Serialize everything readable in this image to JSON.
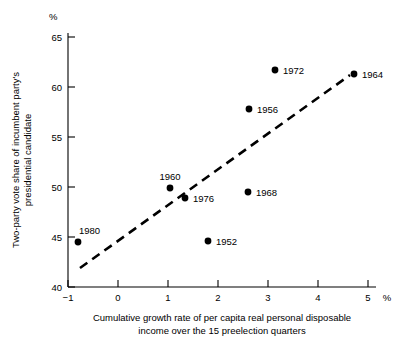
{
  "chart_data": {
    "type": "scatter",
    "title": "",
    "xlabel": "Cumulative growth rate of per capita real personal disposable income over the 15 preelection quarters",
    "xlabel_line1": "Cumulative growth rate of per capita real personal disposable",
    "xlabel_line2": "income over the 15 preelection quarters",
    "ylabel": "Two-party vote share of incumbent party's presidential candidate",
    "ylabel_line1": "Two-party vote share of incumbent party's",
    "ylabel_line2": "presidential candidate",
    "x_unit": "%",
    "y_unit": "%",
    "xlim": [
      -1,
      5
    ],
    "ylim": [
      40,
      65
    ],
    "xticks": [
      -1,
      0,
      1,
      2,
      3,
      4,
      5
    ],
    "xticklabels": [
      "−1",
      "0",
      "1",
      "2",
      "3",
      "4",
      "5"
    ],
    "yticks": [
      40,
      45,
      50,
      55,
      60,
      65
    ],
    "yticklabels": [
      "40",
      "45",
      "50",
      "55",
      "60",
      "65"
    ],
    "grid": false,
    "legend": "none",
    "marker_color": "#000000",
    "trendline": {
      "style": "dashed",
      "color": "#000000",
      "x_start": -0.76,
      "y_start": 41.9,
      "x_end": 4.64,
      "y_end": 61.2
    },
    "points": [
      {
        "label": "1980",
        "x": -0.8,
        "y": 44.5,
        "label_pos": "above-right"
      },
      {
        "label": "1960",
        "x": 1.04,
        "y": 49.9,
        "label_pos": "above"
      },
      {
        "label": "1976",
        "x": 1.34,
        "y": 48.9,
        "label_pos": "right"
      },
      {
        "label": "1952",
        "x": 1.8,
        "y": 44.6,
        "label_pos": "right"
      },
      {
        "label": "1968",
        "x": 2.6,
        "y": 49.5,
        "label_pos": "right"
      },
      {
        "label": "1956",
        "x": 2.62,
        "y": 57.8,
        "label_pos": "right"
      },
      {
        "label": "1972",
        "x": 3.14,
        "y": 61.7,
        "label_pos": "right"
      },
      {
        "label": "1964",
        "x": 4.72,
        "y": 61.3,
        "label_pos": "right"
      }
    ]
  }
}
